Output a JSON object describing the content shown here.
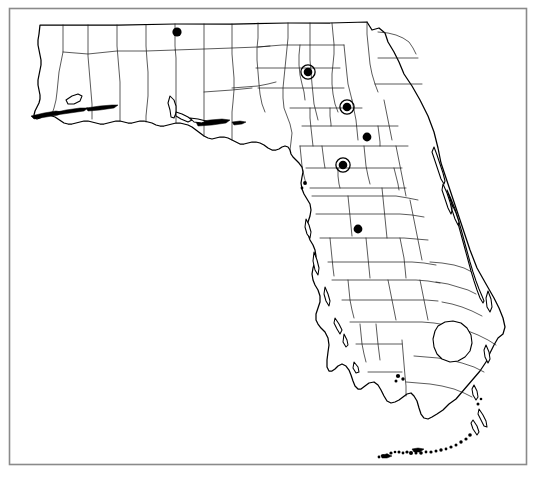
{
  "figure": {
    "frame": {
      "x": 9,
      "y": 8,
      "width": 518,
      "height": 457,
      "stroke_color": "#8a8a8a"
    },
    "background_color": "#ffffff",
    "outline_color": "#000000",
    "county_line_color": "#1a1a1a",
    "marker_color": "#000000"
  },
  "legend": {
    "filled_dot_label": "solid record dot",
    "ringed_dot_label": "solid dot with open ring"
  },
  "markers": [
    {
      "id": "marker-1",
      "type": "dot",
      "x": 177,
      "y": 32,
      "radius": 4.6,
      "ring_radius": 0
    },
    {
      "id": "marker-2",
      "type": "ringed-dot",
      "x": 308,
      "y": 72,
      "radius": 4.3,
      "ring_radius": 7.1
    },
    {
      "id": "marker-3",
      "type": "ringed-dot",
      "x": 347,
      "y": 107,
      "radius": 4.3,
      "ring_radius": 7.1
    },
    {
      "id": "marker-4",
      "type": "dot",
      "x": 367,
      "y": 137,
      "radius": 4.4,
      "ring_radius": 0
    },
    {
      "id": "marker-5",
      "type": "ringed-dot",
      "x": 343,
      "y": 165,
      "radius": 4.3,
      "ring_radius": 7.1
    },
    {
      "id": "marker-6",
      "type": "dot",
      "x": 358,
      "y": 229,
      "radius": 4.4,
      "ring_radius": 0
    }
  ],
  "counts": {
    "total_markers": 6,
    "plain_dots": 3,
    "ringed_dots": 3
  },
  "chart_data": {
    "type": "scatter",
    "xlabel": "",
    "ylabel": "",
    "series": [
      {
        "name": "solid record dot",
        "values": [
          [
            177,
            32
          ],
          [
            367,
            137
          ],
          [
            358,
            229
          ]
        ]
      },
      {
        "name": "solid dot with open ring",
        "values": [
          [
            308,
            72
          ],
          [
            347,
            107
          ],
          [
            343,
            165
          ]
        ]
      }
    ]
  }
}
